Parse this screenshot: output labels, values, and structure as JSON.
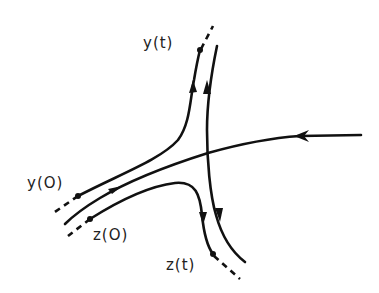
{
  "diagram": {
    "labels": {
      "y_start": "y(O)",
      "z_start": "z(O)",
      "y_end": "y(t)",
      "z_end": "z(t)"
    },
    "colors": {
      "stroke": "#111111",
      "background": "#ffffff"
    },
    "trajectories": [
      {
        "name": "y-trajectory",
        "from": "y(O)",
        "to": "y(t)",
        "direction": "up"
      },
      {
        "name": "z-trajectory",
        "from": "z(O)",
        "to": "z(t)",
        "direction": "down"
      },
      {
        "name": "stable-manifold",
        "direction": "leftward, toward saddle from right"
      },
      {
        "name": "unstable-manifold",
        "direction": "up and down away from saddle"
      }
    ]
  }
}
